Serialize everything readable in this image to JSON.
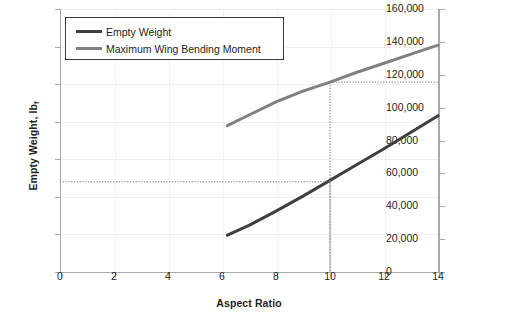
{
  "chart_data": {
    "type": "line",
    "title": "",
    "xlabel": "Aspect Ratio",
    "ylabel": "Empty Weight, lb",
    "ylabel_sub": "f",
    "y2label": "Maximum Bending Moment, ft·lb",
    "y2label_sub": "f",
    "xlim": [
      0,
      14
    ],
    "ylim": [
      2200,
      2550
    ],
    "y2lim": [
      0,
      160000
    ],
    "grid": true,
    "legend_position": "top-left",
    "xticks": [
      "0",
      "2",
      "4",
      "6",
      "8",
      "10",
      "12",
      "14"
    ],
    "xtick_values": [
      0,
      2,
      4,
      6,
      8,
      10,
      12,
      14
    ],
    "yticks": [
      "2200",
      "2250",
      "2300",
      "2350",
      "2400",
      "2450",
      "2500",
      "2550"
    ],
    "ytick_values": [
      2200,
      2250,
      2300,
      2350,
      2400,
      2450,
      2500,
      2550
    ],
    "y2ticks": [
      "0",
      "20,000",
      "40,000",
      "60,000",
      "80,000",
      "100,000",
      "120,000",
      "140,000",
      "160,000"
    ],
    "y2tick_values": [
      0,
      20000,
      40000,
      60000,
      80000,
      100000,
      120000,
      140000,
      160000
    ],
    "series": [
      {
        "name": "Empty Weight",
        "axis": "left",
        "color": "#3f3f3f",
        "x": [
          6.2,
          7.0,
          8.0,
          9.0,
          10.0,
          11.0,
          12.0,
          13.0,
          14.0
        ],
        "values": [
          2249,
          2262,
          2281,
          2301,
          2322,
          2343,
          2364,
          2386,
          2408
        ]
      },
      {
        "name": "Maximum Wing Bending Moment",
        "axis": "right",
        "color": "#808080",
        "x": [
          6.2,
          7.0,
          8.0,
          9.0,
          10.0,
          11.0,
          12.0,
          13.0,
          14.0
        ],
        "values": [
          89000,
          95500,
          103500,
          110000,
          115500,
          121500,
          127000,
          132500,
          138000
        ]
      }
    ],
    "annotations": [
      {
        "name": "empty-weight-readout",
        "type": "guide-lines",
        "x": 10.0,
        "y_left": 2320,
        "style": "dotted"
      },
      {
        "name": "bending-moment-readout",
        "type": "guide-lines",
        "x": 10.0,
        "y_right": 115500,
        "style": "dotted"
      }
    ]
  },
  "legend": {
    "items": [
      {
        "label": "Empty Weight",
        "color": "#3f3f3f"
      },
      {
        "label": "Maximum Wing Bending Moment",
        "color": "#808080"
      }
    ]
  }
}
